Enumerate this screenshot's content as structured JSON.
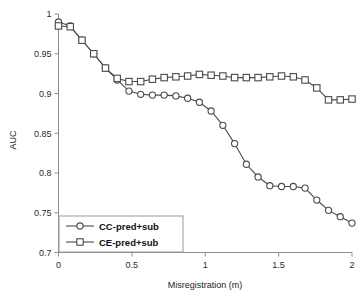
{
  "chart_data": {
    "type": "line",
    "title": "",
    "xlabel": "Misregistration (m)",
    "ylabel": "AUC",
    "xlim": [
      0,
      2
    ],
    "ylim": [
      0.7,
      1
    ],
    "grid": false,
    "legend_position": "bottom-left",
    "xticks": [
      "0",
      "0.5",
      "1",
      "1.5",
      "2"
    ],
    "xtick_values": [
      0,
      0.5,
      1,
      1.5,
      2
    ],
    "yticks": [
      "0.7",
      "0.75",
      "0.8",
      "0.85",
      "0.9",
      "0.95",
      "1"
    ],
    "ytick_values": [
      0.7,
      0.75,
      0.8,
      0.85,
      0.9,
      0.95,
      1
    ],
    "x": [
      0,
      0.08,
      0.16,
      0.24,
      0.32,
      0.4,
      0.48,
      0.56,
      0.64,
      0.72,
      0.8,
      0.88,
      0.96,
      1.04,
      1.12,
      1.2,
      1.28,
      1.36,
      1.44,
      1.52,
      1.6,
      1.68,
      1.76,
      1.84,
      1.92,
      2.0
    ],
    "series": [
      {
        "name": "CC-pred+sub",
        "marker": "circle",
        "color": "#4a4a4a",
        "values": [
          0.99,
          0.985,
          0.967,
          0.95,
          0.932,
          0.917,
          0.903,
          0.899,
          0.898,
          0.898,
          0.897,
          0.894,
          0.889,
          0.878,
          0.86,
          0.837,
          0.811,
          0.795,
          0.784,
          0.783,
          0.783,
          0.781,
          0.766,
          0.753,
          0.745,
          0.737
        ]
      },
      {
        "name": "CE-pred+sub",
        "marker": "square",
        "color": "#4a4a4a",
        "values": [
          0.985,
          0.984,
          0.967,
          0.95,
          0.932,
          0.919,
          0.915,
          0.915,
          0.918,
          0.92,
          0.921,
          0.922,
          0.924,
          0.923,
          0.922,
          0.92,
          0.92,
          0.92,
          0.921,
          0.922,
          0.921,
          0.917,
          0.907,
          0.892,
          0.892,
          0.893
        ]
      }
    ]
  },
  "legend": {
    "entries": [
      {
        "label": "CC-pred+sub",
        "marker": "circle-marker"
      },
      {
        "label": "CE-pred+sub",
        "marker": "square-marker"
      }
    ]
  }
}
